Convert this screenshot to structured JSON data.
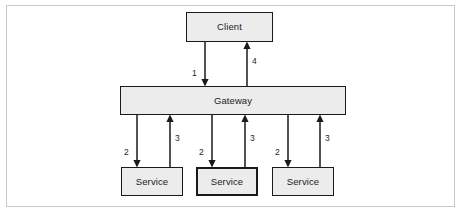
{
  "figure": {
    "kind": "api-gateway-architecture-diagram",
    "background_color": "#ffffff",
    "frame_border_color": "#c9c9c9",
    "node_fill_color": "#ececec",
    "node_border_color": "#1a1a1a",
    "text_color": "#1c1c1c"
  },
  "nodes": {
    "client": {
      "label": "Client"
    },
    "gateway": {
      "label": "Gateway"
    },
    "services": [
      {
        "label": "Service"
      },
      {
        "label": "Service"
      },
      {
        "label": "Service"
      }
    ]
  },
  "edges": {
    "client_to_gateway": {
      "label": "1",
      "direction": "down"
    },
    "gateway_to_client": {
      "label": "4",
      "direction": "up"
    },
    "gateway_to_service_1": {
      "label": "2",
      "direction": "down"
    },
    "service_1_to_gateway": {
      "label": "3",
      "direction": "up"
    },
    "gateway_to_service_2": {
      "label": "2",
      "direction": "down"
    },
    "service_2_to_gateway": {
      "label": "3",
      "direction": "up"
    },
    "gateway_to_service_3": {
      "label": "2",
      "direction": "down"
    },
    "service_3_to_gateway": {
      "label": "3",
      "direction": "up"
    }
  }
}
